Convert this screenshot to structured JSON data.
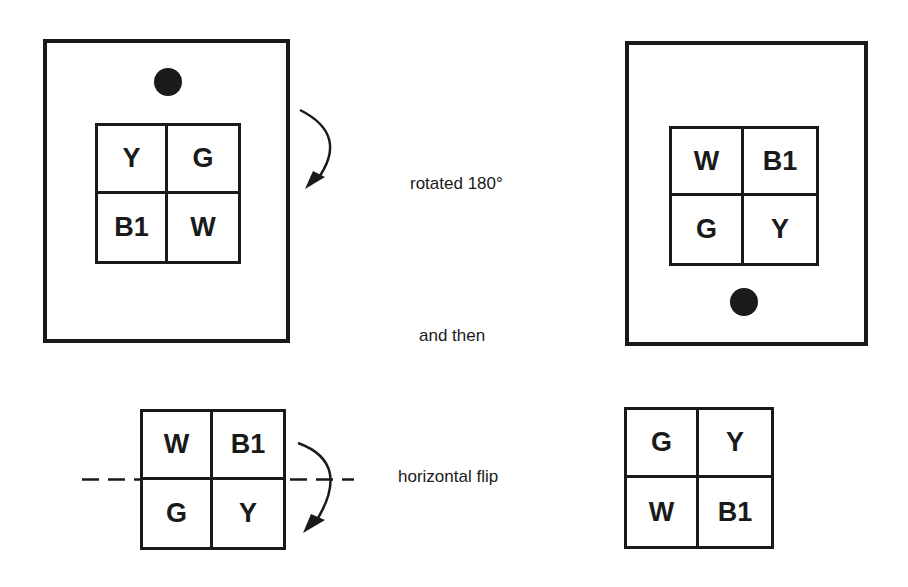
{
  "labels": {
    "step1": "rotated 180°",
    "connector": "and then",
    "step2": "horizontal flip"
  },
  "panels": {
    "original": {
      "cells": [
        "Y",
        "G",
        "B1",
        "W"
      ],
      "dot": "top"
    },
    "rotated": {
      "cells": [
        "W",
        "B1",
        "G",
        "Y"
      ],
      "dot": "bottom"
    },
    "flip_input": {
      "cells": [
        "W",
        "B1",
        "G",
        "Y"
      ]
    },
    "flipped": {
      "cells": [
        "G",
        "Y",
        "W",
        "B1"
      ]
    }
  },
  "colors": {
    "ink": "#1a1a1a",
    "background": "#ffffff"
  }
}
